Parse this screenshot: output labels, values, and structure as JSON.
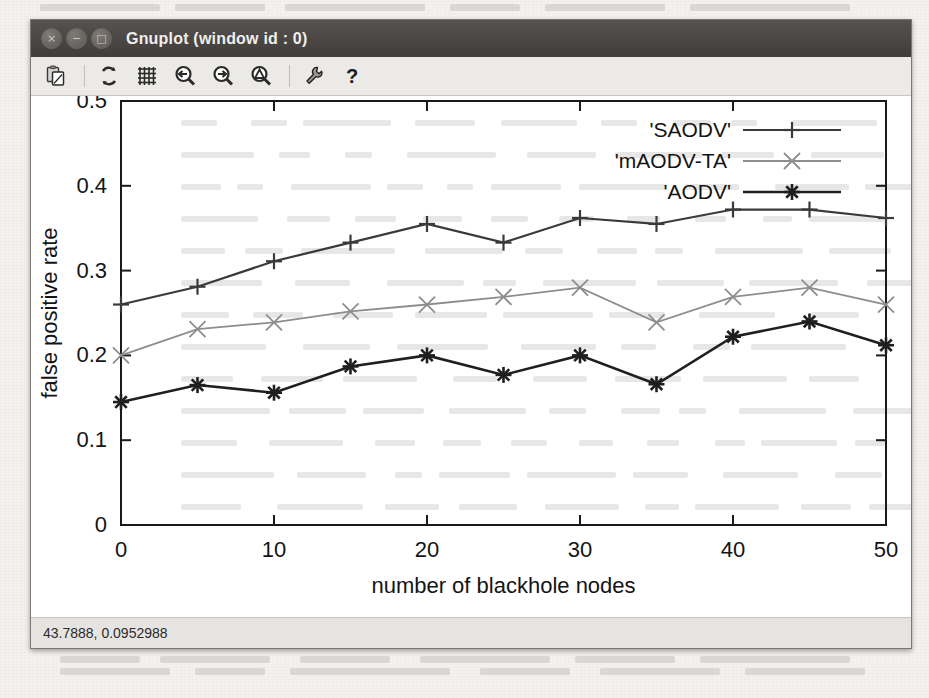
{
  "window": {
    "title": "Gnuplot (window id : 0)",
    "buttons": [
      {
        "name": "close",
        "glyph": "×"
      },
      {
        "name": "minimize",
        "glyph": "−"
      },
      {
        "name": "maximize",
        "glyph": "□"
      }
    ]
  },
  "toolbar": {
    "items": [
      {
        "name": "copy-to-clipboard-icon",
        "label": "Copy to clipboard"
      },
      {
        "name": "replot-icon",
        "label": "Replot"
      },
      {
        "name": "toggle-grid-icon",
        "label": "Toggle grid"
      },
      {
        "name": "previous-zoom-icon",
        "label": "Previous zoom"
      },
      {
        "name": "next-zoom-icon",
        "label": "Next zoom"
      },
      {
        "name": "autoscale-icon",
        "label": "Autoscale"
      },
      {
        "name": "settings-icon",
        "label": "Settings"
      },
      {
        "name": "help-icon",
        "label": "Help"
      }
    ]
  },
  "statusbar": {
    "coordinates": "43.7888, 0.0952988"
  },
  "chart_data": {
    "type": "line",
    "title": "",
    "xlabel": "number of blackhole nodes",
    "ylabel": "false positive rate",
    "xlim": [
      0,
      50
    ],
    "ylim": [
      0,
      0.5
    ],
    "xticks": [
      0,
      10,
      20,
      30,
      40,
      50
    ],
    "yticks": [
      "0",
      "0.1",
      "0.2",
      "0.3",
      "0.4",
      "0.5"
    ],
    "ytick_values": [
      0,
      0.1,
      0.2,
      0.3,
      0.4,
      0.5
    ],
    "grid": false,
    "legend_position": "top-right",
    "x": [
      0,
      5,
      10,
      15,
      20,
      25,
      30,
      35,
      40,
      45,
      50
    ],
    "series": [
      {
        "name": "'SAODV'",
        "marker": "plus",
        "color": "#3a3a3a",
        "values": [
          0.26,
          0.281,
          0.311,
          0.333,
          0.355,
          0.333,
          0.362,
          0.355,
          0.372,
          0.372,
          0.362
        ]
      },
      {
        "name": "'mAODV-TA'",
        "marker": "cross",
        "color": "#8d8d8d",
        "values": [
          0.2,
          0.231,
          0.239,
          0.252,
          0.26,
          0.269,
          0.28,
          0.239,
          0.269,
          0.28,
          0.26
        ]
      },
      {
        "name": "'AODV'",
        "marker": "star",
        "color": "#1f1f1f",
        "values": [
          0.145,
          0.165,
          0.156,
          0.187,
          0.2,
          0.177,
          0.2,
          0.166,
          0.222,
          0.24,
          0.212
        ]
      }
    ]
  }
}
